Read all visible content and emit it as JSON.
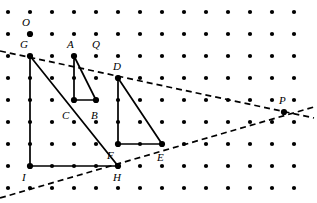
{
  "figure": {
    "canvas": {
      "width": 317,
      "height": 203,
      "background": "#ffffff"
    },
    "lattice": {
      "name": "dot-grid",
      "cols": 14,
      "rows": 9,
      "origin_x": 8,
      "origin_y": 12,
      "spacing": 22,
      "dot_radius": 2.1,
      "dot_color": "#000000"
    },
    "stroke": {
      "solid_color": "#000000",
      "solid_width": 1.7,
      "dashed_color": "#000000",
      "dashed_width": 1.7,
      "dash_pattern": "6,4"
    },
    "points": [
      {
        "label": "O",
        "name": "point-O",
        "gx": 1,
        "gy": 1,
        "x": 30,
        "y": 34,
        "marked": true,
        "lx": 22,
        "ly": 17
      },
      {
        "label": "G",
        "name": "point-G",
        "gx": 1,
        "gy": 2,
        "x": 30,
        "y": 56,
        "marked": true,
        "lx": 20,
        "ly": 39
      },
      {
        "label": "A",
        "name": "point-A",
        "gx": 3,
        "gy": 2,
        "x": 74,
        "y": 56,
        "marked": true,
        "lx": 67,
        "ly": 39
      },
      {
        "label": "Q",
        "name": "point-Q",
        "gx": 4,
        "gy": 2,
        "x": 96,
        "y": 56,
        "marked": false,
        "lx": 92,
        "ly": 39
      },
      {
        "label": "D",
        "name": "point-D",
        "gx": 5,
        "gy": 3,
        "x": 118,
        "y": 78,
        "marked": true,
        "lx": 113,
        "ly": 61
      },
      {
        "label": "C",
        "name": "point-C",
        "gx": 3,
        "gy": 4,
        "x": 74,
        "y": 100,
        "marked": true,
        "lx": 62,
        "ly": 110
      },
      {
        "label": "B",
        "name": "point-B",
        "gx": 4,
        "gy": 4,
        "x": 96,
        "y": 100,
        "marked": true,
        "lx": 91,
        "ly": 110
      },
      {
        "label": "P",
        "name": "point-P",
        "gx": 12,
        "gy": 5,
        "x": 284,
        "y": 112,
        "marked": true,
        "lx": 279,
        "ly": 95
      },
      {
        "label": "F",
        "name": "point-F",
        "gx": 5,
        "gy": 6,
        "x": 118,
        "y": 144,
        "marked": true,
        "lx": 107,
        "ly": 150
      },
      {
        "label": "E",
        "name": "point-E",
        "gx": 7,
        "gy": 6,
        "x": 162,
        "y": 144,
        "marked": true,
        "lx": 157,
        "ly": 152
      },
      {
        "label": "I",
        "name": "point-I",
        "gx": 1,
        "gy": 7,
        "x": 30,
        "y": 166,
        "marked": true,
        "lx": 22,
        "ly": 172
      },
      {
        "label": "H",
        "name": "point-H",
        "gx": 5,
        "gy": 7,
        "x": 118,
        "y": 166,
        "marked": true,
        "lx": 113,
        "ly": 172
      }
    ],
    "triangles": [
      {
        "name": "triangle-ACB",
        "vertices": "A,C,B",
        "path": "74,56 74,100 96,100 74,56"
      },
      {
        "name": "triangle-DFE",
        "vertices": "D,F,E",
        "path": "118,78 118,144 162,144 118,78"
      },
      {
        "name": "triangle-GIH",
        "vertices": "G,I,H",
        "path": "30,56 30,166 118,166 30,56"
      }
    ],
    "dashed_lines": [
      {
        "name": "dashed-line-upper",
        "through": "G, A, D, P",
        "x1": 0,
        "y1": 51,
        "x2": 314,
        "y2": 118
      },
      {
        "name": "dashed-line-lower",
        "through": "I-side, H, E, P",
        "x1": 0,
        "y1": 198,
        "x2": 314,
        "y2": 107
      }
    ]
  }
}
